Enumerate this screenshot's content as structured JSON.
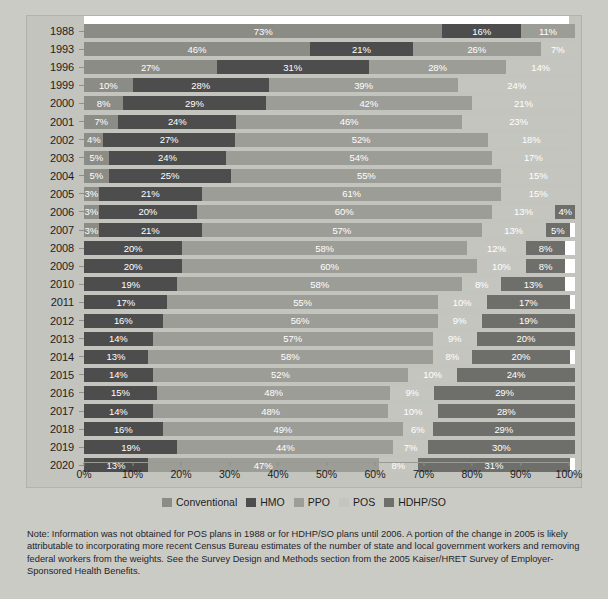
{
  "chart_data": {
    "type": "bar",
    "orientation": "horizontal",
    "stacked": true,
    "title": "",
    "xlabel": "",
    "ylabel": "",
    "xlim": [
      0,
      100
    ],
    "grid": false,
    "legend_position": "bottom",
    "categories": [
      "1988",
      "1993",
      "1996",
      "1999",
      "2000",
      "2001",
      "2002",
      "2003",
      "2004",
      "2005",
      "2006",
      "2007",
      "2008",
      "2009",
      "2010",
      "2011",
      "2012",
      "2013",
      "2014",
      "2015",
      "2016",
      "2017",
      "2018",
      "2019",
      "2020"
    ],
    "xticks": [
      "0%",
      "10%",
      "20%",
      "30%",
      "40%",
      "50%",
      "60%",
      "70%",
      "80%",
      "90%",
      "100%"
    ],
    "xtick_values": [
      0,
      10,
      20,
      30,
      40,
      50,
      60,
      70,
      80,
      90,
      100
    ],
    "series": [
      {
        "name": "Conventional",
        "color": "#8c8c87",
        "values": [
          73,
          46,
          27,
          10,
          8,
          7,
          4,
          5,
          5,
          3,
          3,
          3,
          null,
          null,
          null,
          null,
          null,
          null,
          null,
          null,
          null,
          null,
          null,
          null,
          null
        ]
      },
      {
        "name": "HMO",
        "color": "#4d4d4d",
        "values": [
          16,
          21,
          31,
          28,
          29,
          24,
          27,
          24,
          25,
          21,
          20,
          21,
          20,
          20,
          19,
          17,
          16,
          14,
          13,
          14,
          15,
          14,
          16,
          19,
          13
        ]
      },
      {
        "name": "PPO",
        "color": "#9d9d98",
        "values": [
          11,
          26,
          28,
          39,
          42,
          46,
          52,
          54,
          55,
          61,
          60,
          57,
          58,
          60,
          58,
          55,
          56,
          57,
          58,
          52,
          48,
          48,
          49,
          44,
          47
        ]
      },
      {
        "name": "POS",
        "color": "#c5c5c0",
        "values": [
          null,
          7,
          14,
          24,
          21,
          23,
          18,
          17,
          15,
          15,
          13,
          13,
          12,
          10,
          8,
          10,
          9,
          9,
          8,
          10,
          9,
          10,
          6,
          7,
          8
        ]
      },
      {
        "name": "HDHP/SO",
        "color": "#6e6e6a",
        "values": [
          null,
          null,
          null,
          null,
          null,
          null,
          null,
          null,
          null,
          null,
          4,
          5,
          8,
          8,
          13,
          17,
          19,
          20,
          20,
          24,
          29,
          28,
          29,
          30,
          31
        ]
      }
    ],
    "rows": [
      {
        "year": "1988",
        "segments": [
          {
            "series": "Conventional",
            "value": 73,
            "label": "73%"
          },
          {
            "series": "HMO",
            "value": 16,
            "label": "16%"
          },
          {
            "series": "PPO",
            "value": 11,
            "label": "11%"
          }
        ]
      },
      {
        "year": "1993",
        "segments": [
          {
            "series": "Conventional",
            "value": 46,
            "label": "46%"
          },
          {
            "series": "HMO",
            "value": 21,
            "label": "21%"
          },
          {
            "series": "PPO",
            "value": 26,
            "label": "26%"
          },
          {
            "series": "POS",
            "value": 7,
            "label": "7%"
          }
        ]
      },
      {
        "year": "1996",
        "segments": [
          {
            "series": "Conventional",
            "value": 27,
            "label": "27%"
          },
          {
            "series": "HMO",
            "value": 31,
            "label": "31%"
          },
          {
            "series": "PPO",
            "value": 28,
            "label": "28%"
          },
          {
            "series": "POS",
            "value": 14,
            "label": "14%"
          }
        ]
      },
      {
        "year": "1999",
        "segments": [
          {
            "series": "Conventional",
            "value": 10,
            "label": "10%"
          },
          {
            "series": "HMO",
            "value": 28,
            "label": "28%"
          },
          {
            "series": "PPO",
            "value": 39,
            "label": "39%"
          },
          {
            "series": "POS",
            "value": 24,
            "label": "24%"
          }
        ]
      },
      {
        "year": "2000",
        "segments": [
          {
            "series": "Conventional",
            "value": 8,
            "label": "8%"
          },
          {
            "series": "HMO",
            "value": 29,
            "label": "29%"
          },
          {
            "series": "PPO",
            "value": 42,
            "label": "42%"
          },
          {
            "series": "POS",
            "value": 21,
            "label": "21%"
          }
        ]
      },
      {
        "year": "2001",
        "segments": [
          {
            "series": "Conventional",
            "value": 7,
            "label": "7%"
          },
          {
            "series": "HMO",
            "value": 24,
            "label": "24%"
          },
          {
            "series": "PPO",
            "value": 46,
            "label": "46%"
          },
          {
            "series": "POS",
            "value": 23,
            "label": "23%"
          }
        ]
      },
      {
        "year": "2002",
        "segments": [
          {
            "series": "Conventional",
            "value": 4,
            "label": "4%"
          },
          {
            "series": "HMO",
            "value": 27,
            "label": "27%"
          },
          {
            "series": "PPO",
            "value": 52,
            "label": "52%"
          },
          {
            "series": "POS",
            "value": 18,
            "label": "18%"
          }
        ]
      },
      {
        "year": "2003",
        "segments": [
          {
            "series": "Conventional",
            "value": 5,
            "label": "5%"
          },
          {
            "series": "HMO",
            "value": 24,
            "label": "24%"
          },
          {
            "series": "PPO",
            "value": 54,
            "label": "54%"
          },
          {
            "series": "POS",
            "value": 17,
            "label": "17%"
          }
        ]
      },
      {
        "year": "2004",
        "segments": [
          {
            "series": "Conventional",
            "value": 5,
            "label": "5%"
          },
          {
            "series": "HMO",
            "value": 25,
            "label": "25%"
          },
          {
            "series": "PPO",
            "value": 55,
            "label": "55%"
          },
          {
            "series": "POS",
            "value": 15,
            "label": "15%"
          }
        ]
      },
      {
        "year": "2005",
        "segments": [
          {
            "series": "Conventional",
            "value": 3,
            "label": "3%"
          },
          {
            "series": "HMO",
            "value": 21,
            "label": "21%"
          },
          {
            "series": "PPO",
            "value": 61,
            "label": "61%"
          },
          {
            "series": "POS",
            "value": 15,
            "label": "15%"
          }
        ]
      },
      {
        "year": "2006",
        "segments": [
          {
            "series": "Conventional",
            "value": 3,
            "label": "3%"
          },
          {
            "series": "HMO",
            "value": 20,
            "label": "20%"
          },
          {
            "series": "PPO",
            "value": 60,
            "label": "60%"
          },
          {
            "series": "POS",
            "value": 13,
            "label": "13%"
          },
          {
            "series": "HDHP/SO",
            "value": 4,
            "label": "4%"
          }
        ]
      },
      {
        "year": "2007",
        "segments": [
          {
            "series": "Conventional",
            "value": 3,
            "label": "3%"
          },
          {
            "series": "HMO",
            "value": 21,
            "label": "21%"
          },
          {
            "series": "PPO",
            "value": 57,
            "label": "57%"
          },
          {
            "series": "POS",
            "value": 13,
            "label": "13%"
          },
          {
            "series": "HDHP/SO",
            "value": 5,
            "label": "5%"
          }
        ]
      },
      {
        "year": "2008",
        "segments": [
          {
            "series": "HMO",
            "value": 20,
            "label": "20%"
          },
          {
            "series": "PPO",
            "value": 58,
            "label": "58%"
          },
          {
            "series": "POS",
            "value": 12,
            "label": "12%"
          },
          {
            "series": "HDHP/SO",
            "value": 8,
            "label": "8%"
          }
        ]
      },
      {
        "year": "2009",
        "segments": [
          {
            "series": "HMO",
            "value": 20,
            "label": "20%"
          },
          {
            "series": "PPO",
            "value": 60,
            "label": "60%"
          },
          {
            "series": "POS",
            "value": 10,
            "label": "10%"
          },
          {
            "series": "HDHP/SO",
            "value": 8,
            "label": "8%"
          }
        ]
      },
      {
        "year": "2010",
        "segments": [
          {
            "series": "HMO",
            "value": 19,
            "label": "19%"
          },
          {
            "series": "PPO",
            "value": 58,
            "label": "58%"
          },
          {
            "series": "POS",
            "value": 8,
            "label": "8%"
          },
          {
            "series": "HDHP/SO",
            "value": 13,
            "label": "13%"
          }
        ]
      },
      {
        "year": "2011",
        "segments": [
          {
            "series": "HMO",
            "value": 17,
            "label": "17%"
          },
          {
            "series": "PPO",
            "value": 55,
            "label": "55%"
          },
          {
            "series": "POS",
            "value": 10,
            "label": "10%"
          },
          {
            "series": "HDHP/SO",
            "value": 17,
            "label": "17%"
          }
        ]
      },
      {
        "year": "2012",
        "segments": [
          {
            "series": "HMO",
            "value": 16,
            "label": "16%"
          },
          {
            "series": "PPO",
            "value": 56,
            "label": "56%"
          },
          {
            "series": "POS",
            "value": 9,
            "label": "9%"
          },
          {
            "series": "HDHP/SO",
            "value": 19,
            "label": "19%"
          }
        ]
      },
      {
        "year": "2013",
        "segments": [
          {
            "series": "HMO",
            "value": 14,
            "label": "14%"
          },
          {
            "series": "PPO",
            "value": 57,
            "label": "57%"
          },
          {
            "series": "POS",
            "value": 9,
            "label": "9%"
          },
          {
            "series": "HDHP/SO",
            "value": 20,
            "label": "20%"
          }
        ]
      },
      {
        "year": "2014",
        "segments": [
          {
            "series": "HMO",
            "value": 13,
            "label": "13%"
          },
          {
            "series": "PPO",
            "value": 58,
            "label": "58%"
          },
          {
            "series": "POS",
            "value": 8,
            "label": "8%"
          },
          {
            "series": "HDHP/SO",
            "value": 20,
            "label": "20%"
          }
        ]
      },
      {
        "year": "2015",
        "segments": [
          {
            "series": "HMO",
            "value": 14,
            "label": "14%"
          },
          {
            "series": "PPO",
            "value": 52,
            "label": "52%"
          },
          {
            "series": "POS",
            "value": 10,
            "label": "10%"
          },
          {
            "series": "HDHP/SO",
            "value": 24,
            "label": "24%"
          }
        ]
      },
      {
        "year": "2016",
        "segments": [
          {
            "series": "HMO",
            "value": 15,
            "label": "15%"
          },
          {
            "series": "PPO",
            "value": 48,
            "label": "48%"
          },
          {
            "series": "POS",
            "value": 9,
            "label": "9%"
          },
          {
            "series": "HDHP/SO",
            "value": 29,
            "label": "29%"
          }
        ]
      },
      {
        "year": "2017",
        "segments": [
          {
            "series": "HMO",
            "value": 14,
            "label": "14%"
          },
          {
            "series": "PPO",
            "value": 48,
            "label": "48%"
          },
          {
            "series": "POS",
            "value": 10,
            "label": "10%"
          },
          {
            "series": "HDHP/SO",
            "value": 28,
            "label": "28%"
          }
        ]
      },
      {
        "year": "2018",
        "segments": [
          {
            "series": "HMO",
            "value": 16,
            "label": "16%"
          },
          {
            "series": "PPO",
            "value": 49,
            "label": "49%"
          },
          {
            "series": "POS",
            "value": 6,
            "label": "6%"
          },
          {
            "series": "HDHP/SO",
            "value": 29,
            "label": "29%"
          }
        ]
      },
      {
        "year": "2019",
        "segments": [
          {
            "series": "HMO",
            "value": 19,
            "label": "19%"
          },
          {
            "series": "PPO",
            "value": 44,
            "label": "44%"
          },
          {
            "series": "POS",
            "value": 7,
            "label": "7%"
          },
          {
            "series": "HDHP/SO",
            "value": 30,
            "label": "30%"
          }
        ]
      },
      {
        "year": "2020",
        "segments": [
          {
            "series": "HMO",
            "value": 13,
            "label": "13%"
          },
          {
            "series": "PPO",
            "value": 47,
            "label": "47%"
          },
          {
            "series": "POS",
            "value": 8,
            "label": "8%"
          },
          {
            "series": "HDHP/SO",
            "value": 31,
            "label": "31%"
          }
        ]
      }
    ]
  },
  "legend": {
    "items": [
      {
        "label": "Conventional",
        "color": "#8c8c87"
      },
      {
        "label": "HMO",
        "color": "#4d4d4d"
      },
      {
        "label": "PPO",
        "color": "#9d9d98"
      },
      {
        "label": "POS",
        "color": "#c5c5c0"
      },
      {
        "label": "HDHP/SO",
        "color": "#6e6e6a"
      }
    ]
  },
  "note": {
    "text": "Note: Information was not obtained for POS plans in 1988 or for HDHP/SO plans until 2006. A portion of the change in 2005 is likely attributable to incorporating more recent Census Bureau estimates of the number of state and local government workers and removing federal workers from the weights. See the Survey Design and Methods section from the 2005 Kaiser/HRET Survey of Employer-Sponsored Health Benefits."
  },
  "colors": {
    "page_background": "#cbcbc6",
    "plate_background": "#c4c4bf",
    "bar_track": "#ffffff",
    "text": "#1d1d1d"
  }
}
